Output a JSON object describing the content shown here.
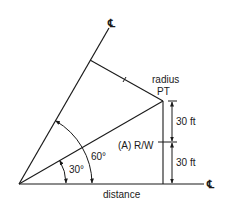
{
  "diagram": {
    "labels": {
      "centerline_top": "℄",
      "centerline_right": "℄",
      "radius": "radius",
      "pt": "PT",
      "dim_upper": "30 ft",
      "dim_lower": "30 ft",
      "row": "(A) R/W",
      "angle_large": "60°",
      "angle_small": "30°",
      "distance": "distance"
    },
    "angles_deg": [
      30,
      60
    ],
    "dimensions_ft": [
      30,
      30
    ],
    "colors": {
      "line": "#1a1a1a",
      "background": "#ffffff"
    }
  }
}
